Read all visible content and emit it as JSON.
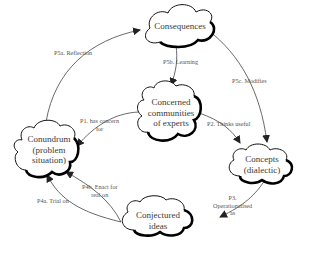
{
  "diagram": {
    "nodes": {
      "consequences": {
        "label": "Consequences"
      },
      "communities": {
        "line1": "Concerned",
        "line2": "communities",
        "line3": "of experts"
      },
      "conundrum": {
        "line1": "Conundrum",
        "line2": "(problem",
        "line3": "situation)"
      },
      "concepts": {
        "line1": "Concepts",
        "line2": "(dialectic)"
      },
      "conjectured": {
        "line1": "Conjectured",
        "line2": "ideas"
      }
    },
    "edges": {
      "p1": {
        "line1": "P1. has concern",
        "line2": "for"
      },
      "p2": {
        "label": "P2. Thinks useful"
      },
      "p3": {
        "line1": "P3.",
        "line2": "Operationalised",
        "line3": "as"
      },
      "p4a": {
        "label": "P4a. Trial on"
      },
      "p4b": {
        "line1": "P4b. Enact for",
        "line2": "real on"
      },
      "p5a": {
        "label": "P5a. Reflection"
      },
      "p5b": {
        "label": "P5b. Learning"
      },
      "p5c": {
        "label": "P5c. Modifies"
      }
    }
  }
}
